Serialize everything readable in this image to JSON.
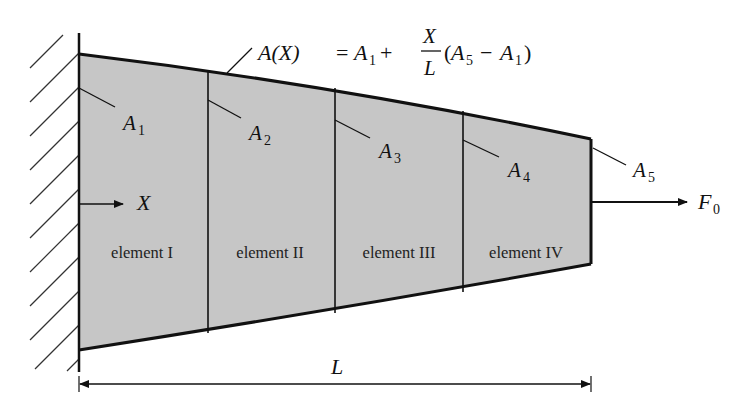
{
  "diagram": {
    "colors": {
      "fill": "#c6c6c6",
      "stroke": "#111111",
      "background": "#ffffff"
    },
    "formula": {
      "lhs": "A(X)",
      "eq": "=",
      "a1": "A",
      "a1_sub": "1",
      "plus": "+",
      "frac_num": "X",
      "frac_den": "L",
      "paren_open": "(",
      "a5": "A",
      "a5_sub": "5",
      "minus": "−",
      "a1b": "A",
      "a1b_sub": "1",
      "paren_close": ")"
    },
    "area_labels": [
      {
        "main": "A",
        "sub": "1"
      },
      {
        "main": "A",
        "sub": "2"
      },
      {
        "main": "A",
        "sub": "3"
      },
      {
        "main": "A",
        "sub": "4"
      },
      {
        "main": "A",
        "sub": "5"
      }
    ],
    "elements": [
      {
        "label": "element I"
      },
      {
        "label": "element II"
      },
      {
        "label": "element III"
      },
      {
        "label": "element IV"
      }
    ],
    "axis": {
      "label": "X"
    },
    "force": {
      "main": "F",
      "sub": "0"
    },
    "length": {
      "label": "L"
    },
    "support": {
      "type": "fixed-wall",
      "icon": "hatched-wall-icon"
    }
  }
}
